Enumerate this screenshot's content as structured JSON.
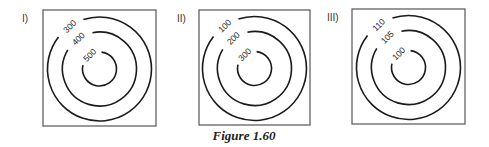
{
  "caption": "Figure 1.60",
  "panels": [
    {
      "label": "I)",
      "contours": [
        "300",
        "400",
        "500"
      ]
    },
    {
      "label": "II)",
      "contours": [
        "100",
        "200",
        "300"
      ]
    },
    {
      "label": "III)",
      "contours": [
        "110",
        "105",
        "100"
      ]
    }
  ],
  "colors": {
    "line": "#1a1a1a",
    "frame": "#555555"
  }
}
